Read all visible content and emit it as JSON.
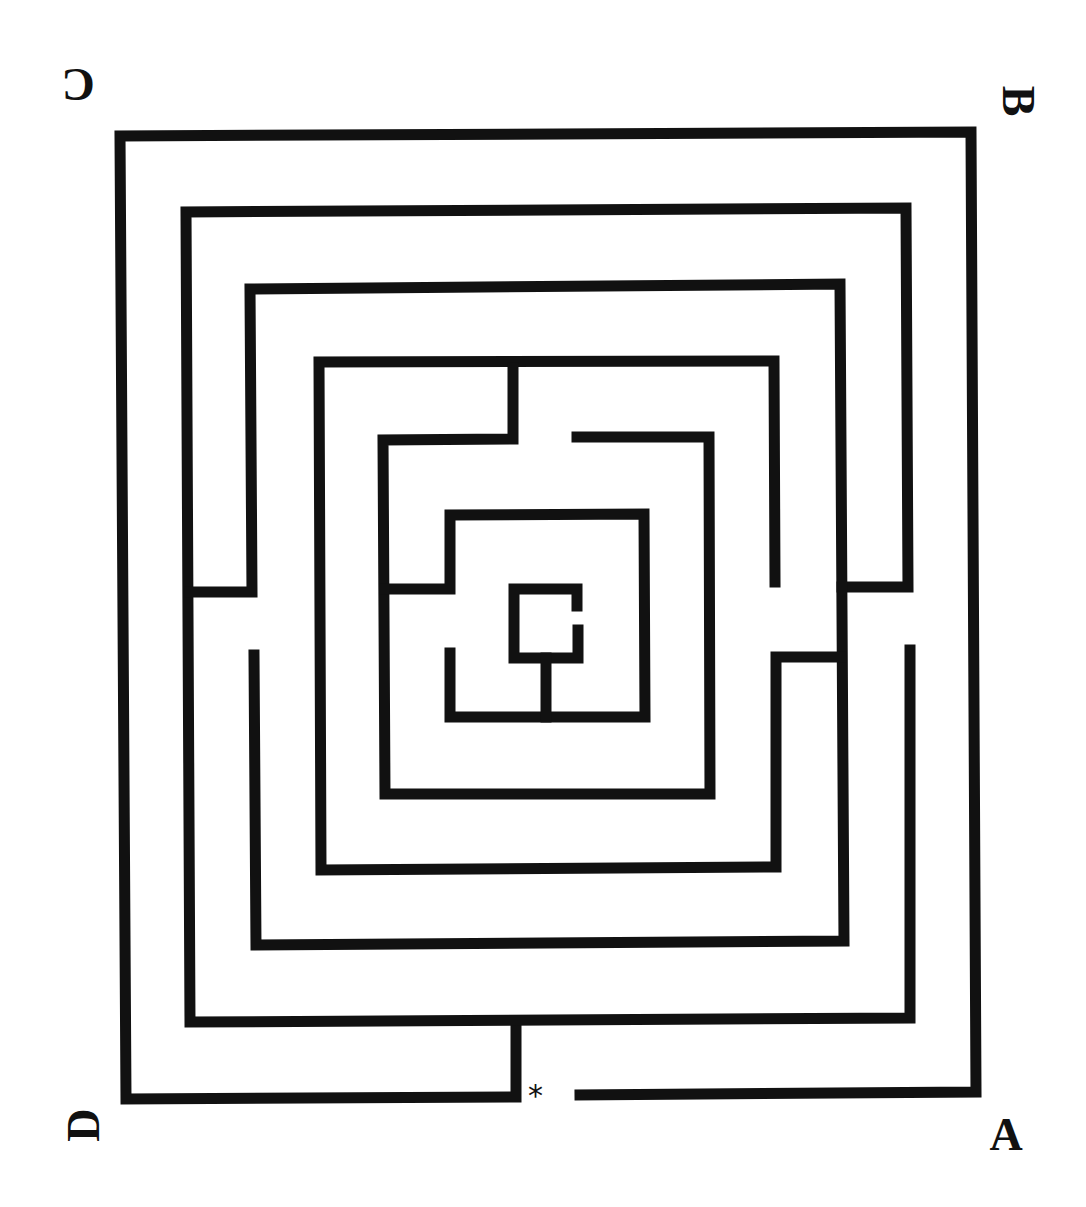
{
  "diagram": {
    "type": "maze",
    "wall_color": "#111111",
    "wall_width": 11,
    "labels": {
      "A": {
        "text": "A",
        "rotation": 0
      },
      "B": {
        "text": "B",
        "rotation": 90
      },
      "C": {
        "text": "C",
        "rotation": 180
      },
      "D": {
        "text": "D",
        "rotation": 270
      }
    },
    "start_marker": "*",
    "walls": [
      [
        [
          516,
          1024
        ],
        [
          516,
          1097
        ],
        [
          126,
          1099
        ],
        [
          120,
          136
        ],
        [
          971,
          132
        ],
        [
          976,
          1092
        ],
        [
          580,
          1095
        ]
      ],
      [
        [
          910,
          650
        ],
        [
          910,
          1018
        ],
        [
          190,
          1022
        ],
        [
          186,
          212
        ],
        [
          906,
          208
        ],
        [
          908,
          587
        ],
        [
          842,
          587
        ]
      ],
      [
        [
          254,
          655
        ],
        [
          256,
          945
        ],
        [
          844,
          941
        ],
        [
          840,
          284
        ],
        [
          250,
          289
        ],
        [
          252,
          592
        ],
        [
          190,
          592
        ]
      ],
      [
        [
          841,
          657
        ],
        [
          776,
          657
        ],
        [
          776,
          867
        ],
        [
          321,
          870
        ],
        [
          319,
          362
        ],
        [
          774,
          361
        ],
        [
          775,
          582
        ]
      ],
      [
        [
          513,
          368
        ],
        [
          513,
          439
        ],
        [
          383,
          440
        ],
        [
          385,
          794
        ],
        [
          710,
          794
        ],
        [
          709,
          437
        ],
        [
          577,
          437
        ]
      ],
      [
        [
          385,
          589
        ],
        [
          450,
          589
        ],
        [
          450,
          515
        ],
        [
          644,
          514
        ],
        [
          645,
          717
        ],
        [
          450,
          717
        ],
        [
          450,
          653
        ]
      ],
      [
        [
          577,
          606
        ],
        [
          577,
          589
        ],
        [
          514,
          589
        ],
        [
          514,
          658
        ],
        [
          578,
          658
        ],
        [
          578,
          630
        ]
      ],
      [
        [
          546,
          658
        ],
        [
          546,
          717
        ]
      ]
    ]
  }
}
